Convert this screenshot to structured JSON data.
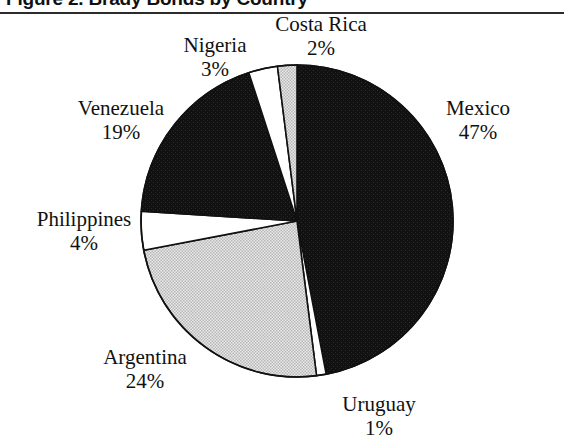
{
  "figure": {
    "title": "Figure 2.  Brady Bonds by Country"
  },
  "chart_data": {
    "type": "pie",
    "title": "Figure 2.  Brady Bonds by Country",
    "xlabel": "",
    "ylabel": "",
    "units": "percent",
    "legend_position": "none",
    "labels_inline": true,
    "start_angle_deg": 0,
    "direction": "clockwise",
    "categories": [
      "Mexico",
      "Uruguay",
      "Argentina",
      "Philippines",
      "Venezuela",
      "Nigeria",
      "Costa Rica"
    ],
    "values": [
      47,
      1,
      24,
      4,
      19,
      3,
      2
    ],
    "slices": [
      {
        "name": "Mexico",
        "value": 47,
        "value_label": "47%",
        "fill": "black",
        "fill_hex": "#111111"
      },
      {
        "name": "Uruguay",
        "value": 1,
        "value_label": "1%",
        "fill": "white",
        "fill_hex": "#ffffff"
      },
      {
        "name": "Argentina",
        "value": 24,
        "value_label": "24%",
        "fill": "gray",
        "fill_hex": "#d4d4d4"
      },
      {
        "name": "Philippines",
        "value": 4,
        "value_label": "4%",
        "fill": "white",
        "fill_hex": "#ffffff"
      },
      {
        "name": "Venezuela",
        "value": 19,
        "value_label": "19%",
        "fill": "black",
        "fill_hex": "#111111"
      },
      {
        "name": "Nigeria",
        "value": 3,
        "value_label": "3%",
        "fill": "white",
        "fill_hex": "#ffffff"
      },
      {
        "name": "Costa Rica",
        "value": 2,
        "value_label": "2%",
        "fill": "gray",
        "fill_hex": "#d4d4d4"
      }
    ]
  },
  "labels": {
    "costa_rica": {
      "name": "Costa Rica",
      "pct": "2%"
    },
    "nigeria": {
      "name": "Nigeria",
      "pct": "3%"
    },
    "mexico": {
      "name": "Mexico",
      "pct": "47%"
    },
    "venezuela": {
      "name": "Venezuela",
      "pct": "19%"
    },
    "philippines": {
      "name": "Philippines",
      "pct": "4%"
    },
    "argentina": {
      "name": "Argentina",
      "pct": "24%"
    },
    "uruguay": {
      "name": "Uruguay",
      "pct": "1%"
    }
  },
  "colors": {
    "ink": "#111111",
    "rule": "#2b2b2b",
    "slice_black": "#111111",
    "slice_gray": "#d4d4d4",
    "slice_white": "#ffffff",
    "page_background": "#ffffff"
  }
}
